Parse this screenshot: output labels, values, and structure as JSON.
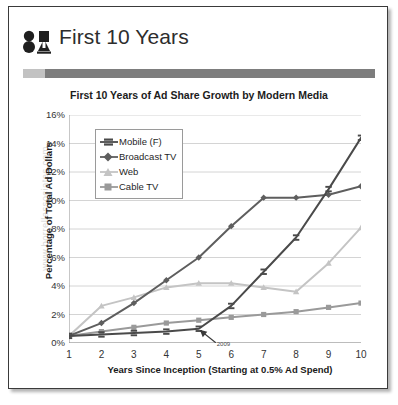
{
  "slide": {
    "header_title": "First 10 Years",
    "logo_name": "BA"
  },
  "watermark": "www.borrellassociates.com",
  "annotation": {
    "label": "2009",
    "x_year": 5
  },
  "legend": {
    "items": [
      {
        "label": "Mobile (F)",
        "color": "#4a4a4a",
        "marker": "dash"
      },
      {
        "label": "Broadcast TV",
        "color": "#5e5e5e",
        "marker": "diamond"
      },
      {
        "label": "Web",
        "color": "#c4c4c4",
        "marker": "triangle"
      },
      {
        "label": "Cable TV",
        "color": "#9a9a9a",
        "marker": "square"
      }
    ]
  },
  "chart_data": {
    "type": "line",
    "title": "First 10 Years of Ad Share Growth by Modern Media",
    "xlabel": "Years Since Inception (Starting at 0.5% Ad Spend)",
    "ylabel": "Percentage of Total Ad Dollars",
    "x": [
      1,
      2,
      3,
      4,
      5,
      6,
      7,
      8,
      9,
      10
    ],
    "xticks": [
      "1",
      "2",
      "3",
      "4",
      "5",
      "6",
      "7",
      "8",
      "9",
      "10"
    ],
    "yticks": [
      "0%",
      "2%",
      "4%",
      "6%",
      "8%",
      "10%",
      "12%",
      "14%",
      "16%"
    ],
    "ylim": [
      0,
      16
    ],
    "xlim": [
      1,
      10
    ],
    "grid": true,
    "legend_position": "upper-left-inside",
    "series": [
      {
        "name": "Mobile (F)",
        "color": "#4a4a4a",
        "marker": "dash",
        "values": [
          0.5,
          0.6,
          0.7,
          0.8,
          1.0,
          2.6,
          5.0,
          7.4,
          10.8,
          14.4
        ]
      },
      {
        "name": "Broadcast TV",
        "color": "#5e5e5e",
        "marker": "diamond",
        "values": [
          0.5,
          1.4,
          2.8,
          4.4,
          6.0,
          8.2,
          10.2,
          10.2,
          10.4,
          11.0
        ]
      },
      {
        "name": "Web",
        "color": "#c4c4c4",
        "marker": "triangle",
        "values": [
          0.5,
          2.6,
          3.2,
          3.9,
          4.2,
          4.2,
          3.9,
          3.6,
          5.6,
          8.1
        ]
      },
      {
        "name": "Cable TV",
        "color": "#9a9a9a",
        "marker": "square",
        "values": [
          0.5,
          0.8,
          1.1,
          1.4,
          1.6,
          1.8,
          2.0,
          2.2,
          2.5,
          2.8
        ]
      }
    ]
  }
}
